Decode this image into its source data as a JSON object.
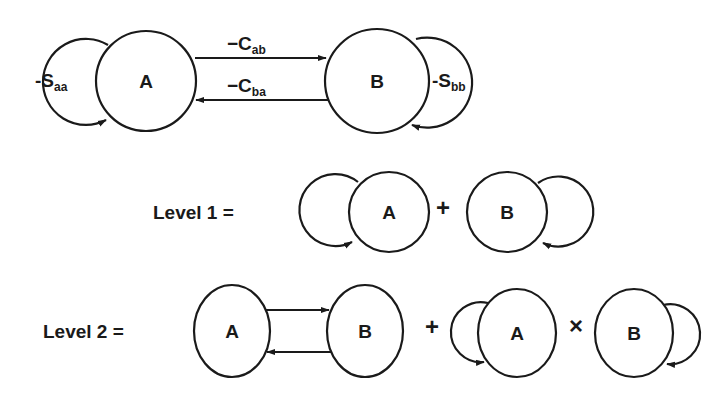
{
  "diagram": {
    "type": "interaction-diagram",
    "top": {
      "nodes": [
        {
          "id": "A",
          "label": "A"
        },
        {
          "id": "B",
          "label": "B"
        }
      ],
      "self_loops": [
        {
          "node": "A",
          "label_main": "-S",
          "label_sub": "aa"
        },
        {
          "node": "B",
          "label_main": "-S",
          "label_sub": "bb"
        }
      ],
      "edges": [
        {
          "from": "A",
          "to": "B",
          "label_main": "−C",
          "label_sub": "ab"
        },
        {
          "from": "B",
          "to": "A",
          "label_main": "−C",
          "label_sub": "ba"
        }
      ]
    },
    "level1": {
      "label": "Level 1 =",
      "terms": [
        {
          "node": "A",
          "self_loop": true
        },
        {
          "node": "B",
          "self_loop": true
        }
      ],
      "operators": [
        "+"
      ]
    },
    "level2": {
      "label": "Level 2 =",
      "terms": [
        {
          "nodes": [
            "A",
            "B"
          ],
          "edges": [
            "A→B",
            "B→A"
          ]
        },
        {
          "node": "A",
          "self_loop": true
        },
        {
          "node": "B",
          "self_loop": true
        }
      ],
      "operators": [
        "+",
        "×"
      ]
    }
  }
}
